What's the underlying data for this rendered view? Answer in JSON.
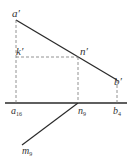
{
  "diagram": {
    "type": "descriptive-geometry-projection",
    "colors": {
      "line": "#2a2a2a",
      "dashed": "#777777",
      "label": "#333333"
    },
    "labels": {
      "a_prime": {
        "base": "a",
        "mark": "′"
      },
      "k_prime": {
        "base": "k",
        "mark": "′"
      },
      "n_prime": {
        "base": "n",
        "mark": "′"
      },
      "b_prime": {
        "base": "b",
        "mark": "′"
      },
      "a16": {
        "base": "a",
        "sub": "16"
      },
      "n9": {
        "base": "n",
        "sub": "9"
      },
      "b4": {
        "base": "b",
        "sub": "4"
      },
      "m9": {
        "base": "m",
        "sub": "9"
      }
    }
  }
}
